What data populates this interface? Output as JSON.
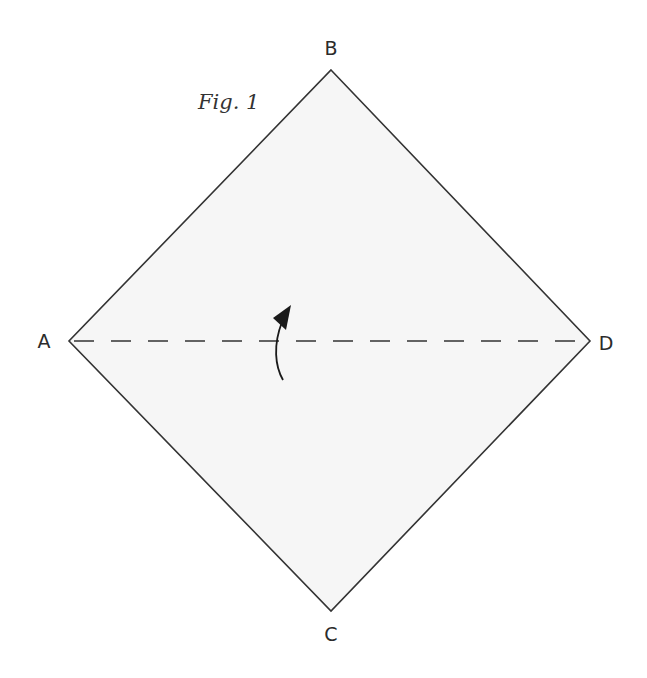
{
  "figure": {
    "caption": "Fig. 1",
    "fill_color": "#f6f6f6",
    "stroke_color": "#333333",
    "vertices": {
      "A": {
        "label": "A",
        "x": 69,
        "y": 341
      },
      "B": {
        "label": "B",
        "x": 331,
        "y": 70
      },
      "C": {
        "label": "C",
        "x": 331,
        "y": 611
      },
      "D": {
        "label": "D",
        "x": 590,
        "y": 341
      }
    },
    "fold_line": {
      "from": "A",
      "to": "D",
      "style": "dashed"
    },
    "fold_arrow": {
      "direction": "up",
      "meaning": "fold bottom half up along A-D"
    }
  }
}
